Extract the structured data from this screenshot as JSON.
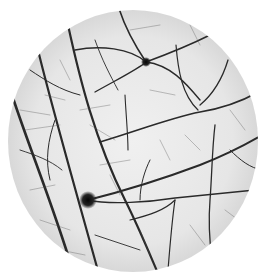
{
  "image": {
    "description": "Grayscale micrograph in circular field of view showing a network of dark vein-like lines with two dark spots",
    "background": "#ffffff",
    "field": {
      "cx": 133,
      "cy": 141,
      "rx": 125,
      "ry": 131,
      "fill": "#e9e9e9",
      "edge": "#d0d0d0"
    },
    "line_color": "#2a2a2a",
    "spots": [
      {
        "name": "upper-spot",
        "cx": 146,
        "cy": 62,
        "r": 4
      },
      {
        "name": "lower-spot",
        "cx": 88,
        "cy": 200,
        "r": 7
      }
    ]
  }
}
